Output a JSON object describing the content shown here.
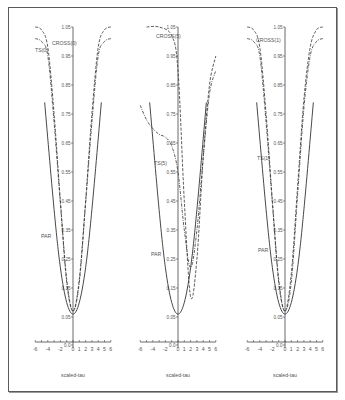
{
  "chart_data": [
    {
      "type": "line",
      "panel": 1,
      "xlabel": "scaled-tau",
      "ylabel": "",
      "x_ticks": [
        -6,
        -4,
        -2,
        0,
        1,
        2,
        3,
        4,
        5,
        6
      ],
      "y_tick_labels": [
        "1.05",
        "0.95",
        "0.85",
        "0.75",
        "0.65",
        "0.55",
        "0.45",
        "0.35",
        "0.25",
        "0.15",
        "0.05",
        "0.0"
      ],
      "xlim": [
        -6,
        6
      ],
      "ylim": [
        0,
        1.05
      ],
      "series": [
        {
          "name": "CROSS(0)",
          "style": "dashed",
          "x": [
            -6,
            -5,
            -4,
            -3,
            -2,
            -1,
            0,
            1,
            2,
            3,
            4,
            5,
            6
          ],
          "y": [
            1.05,
            1.04,
            0.98,
            0.75,
            0.45,
            0.18,
            0.07,
            0.18,
            0.45,
            0.75,
            0.98,
            1.04,
            1.05
          ]
        },
        {
          "name": "TS(0)",
          "style": "dash-dot",
          "x": [
            -6,
            -5,
            -4,
            -3,
            -2,
            -1,
            0,
            1,
            2,
            3,
            4,
            5,
            6
          ],
          "y": [
            1.01,
            1.0,
            0.95,
            0.72,
            0.44,
            0.17,
            0.07,
            0.17,
            0.44,
            0.72,
            0.95,
            1.0,
            1.01
          ]
        },
        {
          "name": "PAR",
          "style": "solid",
          "x": [
            -4.5,
            -3,
            -2,
            -1,
            0,
            1,
            2,
            3,
            4.5
          ],
          "y": [
            0.79,
            0.42,
            0.22,
            0.1,
            0.06,
            0.1,
            0.22,
            0.42,
            0.79
          ]
        }
      ]
    },
    {
      "type": "line",
      "panel": 2,
      "xlabel": "scaled-tau",
      "ylabel": "",
      "x_ticks": [
        -6,
        -4,
        -2,
        0,
        1,
        2,
        3,
        4,
        5,
        6
      ],
      "y_tick_labels": [
        "1.05",
        "0.95",
        "0.85",
        "0.75",
        "0.65",
        "0.55",
        "0.45",
        "0.35",
        "0.25",
        "0.15",
        "0.05",
        "0.0"
      ],
      "xlim": [
        -6,
        6
      ],
      "ylim": [
        0,
        1.05
      ],
      "series": [
        {
          "name": "CROSS(5)",
          "style": "dashed",
          "x": [
            -5,
            -3,
            -1,
            0,
            1,
            2,
            3,
            4,
            5,
            6
          ],
          "y": [
            1.05,
            1.05,
            1.02,
            0.9,
            0.45,
            0.12,
            0.25,
            0.6,
            0.85,
            0.95
          ]
        },
        {
          "name": "TS(5)",
          "style": "dash-dot",
          "x": [
            -6,
            -5,
            -4,
            -3,
            -2,
            -1,
            0,
            1,
            2,
            3,
            4,
            5,
            6
          ],
          "y": [
            0.78,
            0.73,
            0.7,
            0.68,
            0.67,
            0.64,
            0.55,
            0.35,
            0.22,
            0.35,
            0.6,
            0.82,
            0.9
          ]
        },
        {
          "name": "PAR",
          "style": "solid",
          "x": [
            -4.5,
            -3,
            -2,
            -1,
            0,
            1,
            2,
            3,
            4.5
          ],
          "y": [
            0.79,
            0.42,
            0.22,
            0.1,
            0.06,
            0.1,
            0.22,
            0.42,
            0.79
          ]
        }
      ]
    },
    {
      "type": "line",
      "panel": 3,
      "xlabel": "scaled-tau",
      "ylabel": "",
      "x_ticks": [
        -6,
        -4,
        -2,
        0,
        1,
        2,
        3,
        4,
        5,
        6
      ],
      "y_tick_labels": [
        "1.05",
        "0.95",
        "0.85",
        "0.75",
        "0.65",
        "0.55",
        "0.45",
        "0.35",
        "0.25",
        "0.15",
        "0.05",
        "0.0"
      ],
      "xlim": [
        -6,
        6
      ],
      "ylim": [
        0,
        1.05
      ],
      "series": [
        {
          "name": "CROSS(1)",
          "style": "dashed",
          "x": [
            -6,
            -5,
            -4,
            -3,
            -2,
            -1,
            0,
            1,
            2,
            3,
            4,
            5,
            6
          ],
          "y": [
            1.05,
            1.04,
            0.98,
            0.75,
            0.45,
            0.18,
            0.07,
            0.2,
            0.5,
            0.8,
            0.98,
            1.04,
            1.05
          ]
        },
        {
          "name": "TS(1)",
          "style": "dash-dot",
          "x": [
            -6,
            -5,
            -4,
            -3,
            -2,
            -1,
            0,
            1,
            2,
            3,
            4,
            5,
            6
          ],
          "y": [
            1.01,
            1.0,
            0.95,
            0.72,
            0.44,
            0.17,
            0.07,
            0.17,
            0.47,
            0.77,
            0.95,
            1.0,
            1.01
          ]
        },
        {
          "name": "PAR",
          "style": "solid",
          "x": [
            -4.5,
            -3,
            -2,
            -1,
            0,
            1,
            2,
            3,
            4.5
          ],
          "y": [
            0.79,
            0.42,
            0.22,
            0.1,
            0.06,
            0.1,
            0.22,
            0.42,
            0.79
          ]
        }
      ]
    }
  ],
  "panels": [
    {
      "xlabel": "scaled-tau",
      "series_labels": {
        "cross": "CROSS(0)",
        "ts": "TS(0)",
        "par": "PAR"
      }
    },
    {
      "xlabel": "scaled-tau",
      "series_labels": {
        "cross": "CROSS(5)",
        "ts": "TS(5)",
        "par": "PAR"
      }
    },
    {
      "xlabel": "scaled-tau",
      "series_labels": {
        "cross": "CROSS(1)",
        "ts": "TS(1)",
        "par": "PAR"
      }
    }
  ],
  "x_tick_labels": [
    "-6",
    "-4",
    "-2",
    "0",
    "1",
    "2",
    "3",
    "4",
    "5",
    "6"
  ],
  "y_tick_labels": [
    "1.05",
    "0.95",
    "0.85",
    "0.75",
    "0.65",
    "0.55",
    "0.45",
    "0.35",
    "0.25",
    "0.15",
    "0.05",
    "0.0"
  ],
  "colors": {
    "line": "#333333",
    "axis": "#444444",
    "text": "#555555",
    "frame": "#5a5a5a"
  }
}
